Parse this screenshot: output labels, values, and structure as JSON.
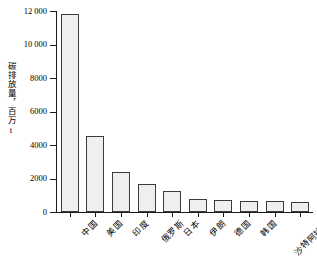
{
  "chart_data": {
    "type": "bar",
    "title": "",
    "subtitle": "",
    "xlabel": "",
    "ylabel": "碳排放量，百万t",
    "ylim": [
      0,
      12000
    ],
    "yticks": [
      "0",
      "2000",
      "4000",
      "6000",
      "8000",
      "10 000",
      "12 000"
    ],
    "ytick_values": [
      0,
      2000,
      4000,
      6000,
      8000,
      10000,
      12000
    ],
    "grid": false,
    "legend": false,
    "legend_position": "none",
    "categories": [
      "中国",
      "美国",
      "印度",
      "俄罗斯",
      "日本",
      "伊朗",
      "德国",
      "韩国",
      "沙特阿拉伯",
      "印度尼西亚"
    ],
    "values": [
      11800,
      4550,
      2400,
      1670,
      1250,
      780,
      700,
      660,
      640,
      620
    ],
    "bar_fill_color": "#efefef",
    "bar_edge_color": "#3c3c3c",
    "axis_color": "#1a1a1a",
    "background_color": "#ffffff"
  }
}
